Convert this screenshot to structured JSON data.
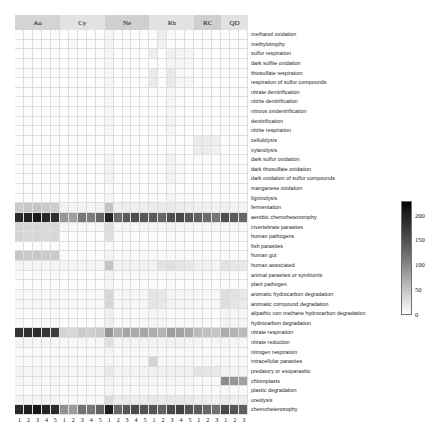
{
  "figure": {
    "type": "heatmap",
    "background": "#ffffff"
  },
  "chart_data": {
    "type": "heatmap",
    "title": "",
    "xlabel": "",
    "ylabel": "",
    "colormap": "greys",
    "grid": true,
    "legend_position": "right",
    "colorbar": {
      "ticks": [
        0,
        50,
        100,
        150,
        200
      ],
      "tick_labels": [
        "0",
        "50",
        "100",
        "150",
        "200"
      ],
      "vmin": 0,
      "vmax": 230,
      "orientation": "vertical"
    },
    "column_groups": [
      {
        "label": "Au",
        "n": 5,
        "shade": "#d4d4d4"
      },
      {
        "label": "Cy",
        "n": 5,
        "shade": "#e2e2e2"
      },
      {
        "label": "Ne",
        "n": 5,
        "shade": "#cfcfcf"
      },
      {
        "label": "Rh",
        "n": 5,
        "shade": "#e2e2e2"
      },
      {
        "label": "RC",
        "n": 3,
        "shade": "#cfcfcf"
      },
      {
        "label": "QD",
        "n": 3,
        "shade": "#e2e2e2"
      }
    ],
    "x": [
      "1",
      "2",
      "3",
      "4",
      "5",
      "1",
      "2",
      "3",
      "4",
      "5",
      "1",
      "2",
      "3",
      "4",
      "5",
      "1",
      "2",
      "3",
      "4",
      "5",
      "1",
      "2",
      "3",
      "1",
      "2",
      "3"
    ],
    "categories": [
      "methanol oxidation",
      "methylotrophy",
      "sulfur respiration",
      "dark sulfite oxidation",
      "thiosulfate respiration",
      "respiration of sulfur compounds",
      "nitrate denitrification",
      "nitrite denitrification",
      "nitrous oxidentrification",
      "denitrification",
      "nitrite respiration",
      "cellulolysis",
      "xylanolysis",
      "dark sulfur oxidation",
      "dark thiosulfate oxidation",
      "dark oxidation of sulfur compounds",
      "manganese oxidation",
      "ligninolysis",
      "fermentation",
      "aerobic chemoheterotrophy",
      "invertebrate parasites",
      "human pathogens",
      "fish parasites",
      "human gut",
      "human associated",
      "animal parasites or symbionts",
      "plant pathogen",
      "aromatic hydrocarbon degradation",
      "aromatic compound degradation",
      "alipathic non methane  hydrocarbon degradation",
      "hydrocarbon degradation",
      "nitrate respiration",
      "nitrate reduction",
      "nitrogen respiration",
      "intracellular parasites",
      "predatory or exoparasitic",
      "chloroplasts",
      "plastic degradation",
      "ureolysis",
      "chemoheterotrophy"
    ],
    "values": [
      [
        4,
        3,
        4,
        3,
        4,
        2,
        3,
        3,
        2,
        3,
        12,
        5,
        4,
        3,
        4,
        5,
        22,
        6,
        5,
        4,
        4,
        3,
        3,
        4,
        3,
        3
      ],
      [
        4,
        3,
        4,
        3,
        4,
        2,
        10,
        3,
        2,
        3,
        14,
        4,
        5,
        3,
        4,
        5,
        18,
        2,
        4,
        4,
        4,
        3,
        3,
        4,
        3,
        3
      ],
      [
        3,
        2,
        3,
        2,
        3,
        2,
        2,
        2,
        2,
        2,
        12,
        2,
        3,
        2,
        3,
        22,
        2,
        18,
        14,
        12,
        2,
        2,
        2,
        2,
        2,
        2
      ],
      [
        3,
        2,
        3,
        2,
        3,
        2,
        2,
        2,
        2,
        2,
        10,
        2,
        3,
        2,
        3,
        2,
        2,
        14,
        12,
        10,
        2,
        2,
        2,
        2,
        2,
        2
      ],
      [
        3,
        2,
        3,
        2,
        3,
        2,
        2,
        2,
        2,
        2,
        10,
        2,
        3,
        2,
        3,
        26,
        2,
        28,
        10,
        8,
        2,
        2,
        2,
        2,
        2,
        2
      ],
      [
        3,
        2,
        3,
        2,
        3,
        2,
        2,
        2,
        2,
        2,
        12,
        3,
        4,
        3,
        4,
        26,
        3,
        28,
        12,
        10,
        3,
        2,
        2,
        3,
        2,
        2
      ],
      [
        4,
        3,
        4,
        3,
        4,
        3,
        3,
        3,
        3,
        3,
        10,
        4,
        4,
        3,
        4,
        4,
        4,
        12,
        5,
        4,
        4,
        3,
        3,
        4,
        3,
        3
      ],
      [
        4,
        3,
        4,
        3,
        4,
        3,
        3,
        3,
        3,
        3,
        10,
        4,
        4,
        3,
        4,
        4,
        4,
        12,
        5,
        4,
        4,
        3,
        3,
        4,
        3,
        3
      ],
      [
        4,
        3,
        4,
        3,
        4,
        3,
        3,
        3,
        3,
        3,
        10,
        4,
        4,
        3,
        4,
        4,
        4,
        12,
        5,
        4,
        4,
        3,
        3,
        4,
        3,
        3
      ],
      [
        4,
        3,
        4,
        3,
        4,
        3,
        3,
        3,
        3,
        3,
        12,
        4,
        5,
        3,
        4,
        5,
        5,
        14,
        6,
        5,
        4,
        3,
        3,
        4,
        3,
        3
      ],
      [
        4,
        3,
        4,
        3,
        4,
        3,
        3,
        3,
        3,
        3,
        10,
        4,
        4,
        3,
        4,
        4,
        4,
        12,
        5,
        4,
        4,
        3,
        3,
        4,
        3,
        3
      ],
      [
        3,
        2,
        3,
        2,
        3,
        2,
        2,
        2,
        2,
        2,
        6,
        3,
        3,
        2,
        3,
        3,
        3,
        6,
        4,
        3,
        26,
        24,
        20,
        3,
        2,
        2
      ],
      [
        3,
        2,
        3,
        2,
        3,
        2,
        2,
        2,
        2,
        2,
        6,
        3,
        3,
        2,
        3,
        3,
        3,
        6,
        4,
        3,
        24,
        22,
        18,
        3,
        2,
        2
      ],
      [
        4,
        3,
        4,
        3,
        4,
        3,
        3,
        3,
        3,
        3,
        14,
        4,
        5,
        3,
        4,
        5,
        5,
        16,
        6,
        5,
        5,
        4,
        3,
        4,
        3,
        3
      ],
      [
        4,
        3,
        4,
        3,
        4,
        3,
        3,
        3,
        3,
        3,
        14,
        4,
        5,
        3,
        4,
        5,
        5,
        16,
        6,
        5,
        5,
        4,
        3,
        4,
        3,
        3
      ],
      [
        4,
        3,
        4,
        3,
        4,
        3,
        3,
        3,
        3,
        3,
        14,
        4,
        5,
        3,
        4,
        5,
        5,
        16,
        6,
        5,
        5,
        4,
        3,
        4,
        3,
        3
      ],
      [
        3,
        2,
        3,
        2,
        3,
        2,
        2,
        2,
        2,
        2,
        8,
        3,
        3,
        2,
        3,
        3,
        3,
        8,
        4,
        3,
        3,
        2,
        2,
        3,
        2,
        2
      ],
      [
        4,
        3,
        4,
        3,
        4,
        3,
        3,
        3,
        3,
        3,
        12,
        4,
        5,
        4,
        5,
        6,
        6,
        14,
        8,
        6,
        6,
        5,
        4,
        5,
        4,
        4
      ],
      [
        62,
        66,
        70,
        64,
        60,
        16,
        14,
        16,
        14,
        16,
        70,
        20,
        24,
        20,
        22,
        24,
        26,
        26,
        24,
        22,
        20,
        18,
        16,
        18,
        16,
        14
      ],
      [
        210,
        215,
        220,
        212,
        208,
        120,
        110,
        150,
        145,
        165,
        215,
        160,
        175,
        185,
        178,
        175,
        165,
        185,
        190,
        178,
        170,
        160,
        150,
        185,
        175,
        165
      ],
      [
        52,
        48,
        50,
        46,
        48,
        10,
        9,
        10,
        9,
        10,
        44,
        12,
        12,
        10,
        12,
        12,
        12,
        14,
        12,
        12,
        11,
        10,
        10,
        11,
        10,
        9
      ],
      [
        52,
        48,
        50,
        46,
        48,
        4,
        3,
        4,
        3,
        4,
        38,
        5,
        5,
        4,
        5,
        5,
        5,
        6,
        5,
        5,
        4,
        4,
        3,
        4,
        4,
        3
      ],
      [
        4,
        3,
        4,
        3,
        4,
        3,
        3,
        3,
        3,
        3,
        8,
        4,
        4,
        3,
        4,
        4,
        4,
        6,
        4,
        4,
        4,
        3,
        3,
        4,
        3,
        3
      ],
      [
        68,
        64,
        66,
        62,
        64,
        6,
        5,
        6,
        5,
        6,
        14,
        7,
        7,
        6,
        7,
        7,
        7,
        8,
        7,
        7,
        6,
        5,
        5,
        6,
        5,
        5
      ],
      [
        14,
        12,
        13,
        12,
        13,
        14,
        12,
        14,
        12,
        14,
        68,
        16,
        18,
        14,
        16,
        16,
        34,
        38,
        32,
        30,
        18,
        16,
        14,
        36,
        30,
        26
      ],
      [
        6,
        5,
        6,
        5,
        6,
        5,
        5,
        5,
        5,
        5,
        14,
        6,
        6,
        5,
        6,
        6,
        6,
        8,
        6,
        6,
        6,
        5,
        5,
        6,
        5,
        5
      ],
      [
        4,
        3,
        4,
        3,
        4,
        3,
        3,
        3,
        3,
        3,
        12,
        4,
        4,
        3,
        4,
        4,
        4,
        6,
        4,
        4,
        4,
        3,
        3,
        4,
        3,
        3
      ],
      [
        10,
        9,
        10,
        9,
        10,
        8,
        8,
        8,
        8,
        8,
        50,
        10,
        12,
        10,
        11,
        34,
        30,
        14,
        12,
        11,
        10,
        9,
        9,
        40,
        34,
        28
      ],
      [
        10,
        9,
        10,
        9,
        10,
        8,
        8,
        8,
        8,
        8,
        48,
        10,
        12,
        10,
        11,
        32,
        28,
        14,
        12,
        11,
        10,
        9,
        9,
        38,
        32,
        26
      ],
      [
        6,
        5,
        6,
        5,
        6,
        5,
        5,
        5,
        5,
        5,
        20,
        6,
        7,
        6,
        7,
        12,
        12,
        8,
        7,
        7,
        6,
        5,
        5,
        14,
        12,
        10
      ],
      [
        6,
        5,
        6,
        5,
        6,
        5,
        5,
        5,
        5,
        5,
        20,
        6,
        7,
        6,
        7,
        12,
        12,
        8,
        7,
        7,
        6,
        5,
        5,
        14,
        12,
        10
      ],
      [
        205,
        208,
        210,
        204,
        200,
        52,
        48,
        62,
        58,
        66,
        120,
        92,
        105,
        98,
        102,
        96,
        88,
        112,
        108,
        100,
        80,
        74,
        68,
        96,
        88,
        80
      ],
      [
        14,
        12,
        13,
        12,
        13,
        10,
        9,
        10,
        9,
        10,
        38,
        12,
        14,
        12,
        13,
        14,
        14,
        16,
        14,
        14,
        12,
        10,
        10,
        13,
        12,
        10
      ],
      [
        6,
        5,
        6,
        5,
        6,
        5,
        5,
        5,
        5,
        5,
        14,
        6,
        7,
        6,
        7,
        7,
        7,
        8,
        7,
        7,
        6,
        5,
        5,
        7,
        6,
        5
      ],
      [
        8,
        7,
        8,
        7,
        8,
        7,
        7,
        7,
        7,
        7,
        12,
        8,
        8,
        7,
        8,
        52,
        10,
        10,
        9,
        9,
        8,
        7,
        7,
        9,
        8,
        7
      ],
      [
        14,
        12,
        13,
        12,
        13,
        12,
        11,
        12,
        11,
        12,
        30,
        14,
        16,
        14,
        15,
        18,
        18,
        20,
        18,
        17,
        34,
        30,
        26,
        16,
        14,
        13
      ],
      [
        10,
        9,
        10,
        9,
        10,
        8,
        8,
        8,
        8,
        8,
        14,
        10,
        10,
        9,
        10,
        10,
        10,
        12,
        10,
        10,
        9,
        8,
        8,
        130,
        120,
        110
      ],
      [
        6,
        5,
        6,
        5,
        6,
        5,
        5,
        5,
        5,
        5,
        12,
        6,
        7,
        6,
        7,
        7,
        7,
        8,
        7,
        7,
        6,
        5,
        5,
        7,
        6,
        5
      ],
      [
        14,
        12,
        13,
        12,
        13,
        10,
        9,
        10,
        9,
        10,
        44,
        22,
        26,
        22,
        24,
        28,
        26,
        30,
        28,
        26,
        24,
        20,
        18,
        26,
        22,
        20
      ],
      [
        212,
        218,
        222,
        214,
        210,
        125,
        115,
        155,
        150,
        170,
        218,
        165,
        180,
        188,
        182,
        180,
        170,
        190,
        195,
        182,
        175,
        165,
        155,
        190,
        180,
        170
      ]
    ]
  }
}
